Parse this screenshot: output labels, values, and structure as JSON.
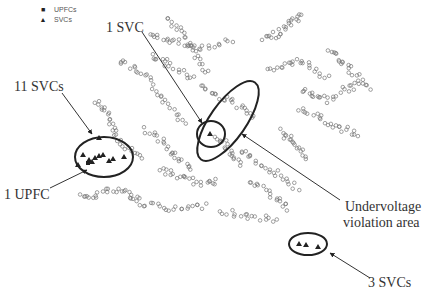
{
  "legend": {
    "items": [
      {
        "symbol": "■",
        "icon": "square-marker-icon",
        "label": "UPFCs"
      },
      {
        "symbol": "▲",
        "icon": "triangle-marker-icon",
        "label": "SVCs"
      }
    ]
  },
  "annotations": {
    "svc_1": "1 SVC",
    "svcs_11": "11 SVCs",
    "upfc_1": "1 UPFC",
    "undervoltage_line1": "Undervoltage",
    "undervoltage_line2": "violation area",
    "svcs_3": "3 SVCs"
  },
  "colors": {
    "bus_marker": "#6e6e6e",
    "ellipse": "#222222",
    "arrow": "#333333",
    "device": "#222222"
  }
}
